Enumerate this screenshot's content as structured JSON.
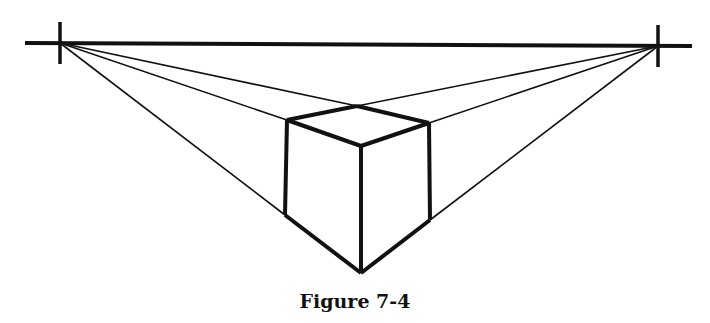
{
  "figure": {
    "caption": "Figure 7-4",
    "type": "two-point perspective cube",
    "line_color": "#111111",
    "horizon": {
      "x1": 25,
      "y1": 43,
      "x2": 692,
      "y2": 46
    },
    "vanishing_points": [
      {
        "name": "left",
        "x": 60,
        "y": 43
      },
      {
        "name": "right",
        "x": 658,
        "y": 46
      }
    ],
    "cube": {
      "top_back": [
        357,
        106
      ],
      "top_left": [
        287,
        120
      ],
      "top_right": [
        429,
        123
      ],
      "top_front": [
        361,
        146
      ],
      "bottom_left": [
        285,
        215
      ],
      "bottom_right": [
        430,
        220
      ],
      "bottom_front": [
        361,
        273
      ]
    }
  }
}
